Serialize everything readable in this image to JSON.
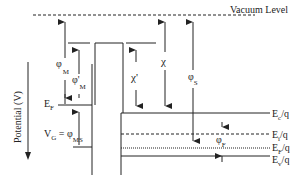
{
  "diagram": {
    "vacuum_level_label": "Vacuum Level",
    "axis_label": "Potential (V)",
    "metal": {
      "fermi_label": "E",
      "fermi_sub": "F",
      "phi_M": {
        "sym": "φ",
        "sub": "M"
      },
      "phi_M_prime": {
        "sym": "φ'",
        "sub": "M"
      },
      "gate_voltage": {
        "lhs": "V",
        "lhs_sub": "G",
        "eq": " = φ",
        "rhs_sub": "MS"
      }
    },
    "oxide": {
      "chi_prime": "χ'"
    },
    "semiconductor": {
      "chi": "χ",
      "phi_S": {
        "sym": "φ",
        "sub": "S"
      },
      "phi_F": {
        "sym": "φ",
        "sub": "F"
      },
      "levels": [
        {
          "main": "E",
          "sub": "c",
          "tail": "/q"
        },
        {
          "main": "E",
          "sub": "i",
          "tail": "/q"
        },
        {
          "main": "E",
          "sub": "F",
          "tail": "/q"
        },
        {
          "main": "E",
          "sub": "v",
          "tail": "/q"
        }
      ]
    },
    "colors": {
      "line": "#222222",
      "background": "#ffffff"
    }
  }
}
